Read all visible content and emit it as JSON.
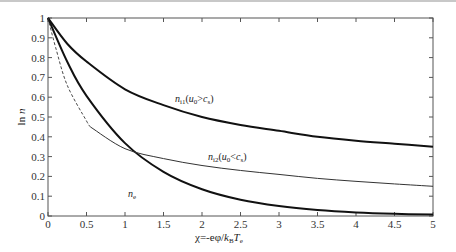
{
  "chart_data": {
    "type": "line",
    "title": "",
    "xlabel": "χ=-eφ/k_B T_e",
    "ylabel": "ln n",
    "xlim": [
      0,
      5
    ],
    "ylim": [
      0,
      1
    ],
    "x_ticks": [
      "0",
      "0.5",
      "1",
      "1.5",
      "2",
      "2.5",
      "3",
      "3.5",
      "4",
      "4.5",
      "5"
    ],
    "y_ticks": [
      "0",
      "0.1",
      "0.2",
      "0.3",
      "0.4",
      "0.5",
      "0.6",
      "0.7",
      "0.8",
      "0.9",
      "1"
    ],
    "grid": false,
    "legend": "inline labels",
    "series": [
      {
        "name": "n_i1(u0>cs)",
        "style": "thick solid",
        "x": [
          0,
          0.25,
          0.5,
          1,
          1.5,
          2,
          2.5,
          3,
          3.5,
          4,
          4.5,
          5
        ],
        "values": [
          1.0,
          0.87,
          0.78,
          0.64,
          0.56,
          0.5,
          0.46,
          0.43,
          0.4,
          0.38,
          0.365,
          0.35
        ]
      },
      {
        "name": "n_i2(u0<cs)",
        "style": "dashed (0–0.55) then thin solid",
        "x": [
          0,
          0.1,
          0.25,
          0.5,
          0.55,
          1,
          1.5,
          2,
          2.5,
          3,
          3.5,
          4,
          4.5,
          5
        ],
        "values": [
          1.0,
          0.85,
          0.66,
          0.48,
          0.45,
          0.34,
          0.29,
          0.255,
          0.23,
          0.21,
          0.19,
          0.175,
          0.162,
          0.15
        ]
      },
      {
        "name": "n_e",
        "style": "thick solid",
        "x": [
          0,
          0.25,
          0.5,
          1,
          1.5,
          2,
          2.5,
          3,
          3.5,
          4,
          4.5,
          5
        ],
        "values": [
          1.0,
          0.779,
          0.607,
          0.368,
          0.223,
          0.135,
          0.082,
          0.05,
          0.03,
          0.018,
          0.011,
          0.007
        ]
      }
    ],
    "annotations": [
      {
        "text": "n_i1(u0>cs)",
        "x": 2.4,
        "y": 0.57
      },
      {
        "text": "n_i2(u0<cs)",
        "x": 2.55,
        "y": 0.28
      },
      {
        "text": "n_e",
        "x": 1.05,
        "y": 0.1
      }
    ]
  },
  "labels": {
    "ylabel_main": "ln n",
    "xlabel_prefix": "χ=-eφ/",
    "xlabel_kb": "k",
    "xlabel_kb_sub": "B",
    "xlabel_T": "T",
    "xlabel_T_sub": "e",
    "ni1_main": "n",
    "ni1_sub": "i1",
    "ni1_cond": "(u",
    "ni1_cond_sub": "0",
    "ni1_cond_rest": ">c",
    "ni1_cond_sub2": "s",
    "ni1_close": ")",
    "ni2_main": "n",
    "ni2_sub": "i2",
    "ni2_cond": "(u",
    "ni2_cond_sub": "0",
    "ni2_cond_rest": "<c",
    "ni2_cond_sub2": "s",
    "ni2_close": ")",
    "ne_main": "n",
    "ne_sub": "e"
  }
}
